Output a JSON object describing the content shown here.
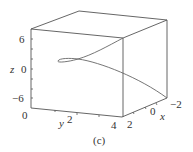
{
  "figure": {
    "caption": "(c)",
    "axes": {
      "z": {
        "label": "z",
        "ticks": [
          "6",
          "0",
          "−6"
        ]
      },
      "y": {
        "label": "y",
        "ticks": [
          "0",
          "2",
          "4"
        ]
      },
      "x": {
        "label": "x",
        "ticks": [
          "2",
          "0",
          "−2"
        ]
      }
    },
    "colors": {
      "line": "#555555",
      "curve": "#666666",
      "text": "#333333"
    }
  }
}
